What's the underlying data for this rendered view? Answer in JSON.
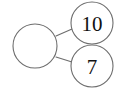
{
  "diagram": {
    "type": "number-bond",
    "background_color": "#ffffff",
    "stroke_color": "#6d6d6d",
    "text_color": "#111111",
    "whole": {
      "label": "",
      "filled": false,
      "cx": 35,
      "cy": 46,
      "r": 22
    },
    "parts": [
      {
        "label": "10",
        "filled": true,
        "cx": 92,
        "cy": 23,
        "r": 21
      },
      {
        "label": "7",
        "filled": true,
        "cx": 92,
        "cy": 66,
        "r": 21
      }
    ],
    "connectors": [
      {
        "x1": 56,
        "y1": 36,
        "x2": 72,
        "y2": 29
      },
      {
        "x1": 56,
        "y1": 57,
        "x2": 72,
        "y2": 62
      }
    ]
  }
}
